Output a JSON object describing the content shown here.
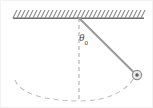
{
  "figure": {
    "name": "simple-pendulum-diagram",
    "background_color": "#ffffff"
  },
  "labels": {
    "angle_symbol": "θ",
    "angle_subscript": "0",
    "angle_full": "θ₀"
  },
  "colors": {
    "ceiling_line": "#6e6e6e",
    "hatching": "#8a8a8a",
    "rod": "#9a9a9a",
    "bob_outline": "#8f8f8f",
    "bob_fill": "#e8e8e8",
    "bob_center": "#5a5a5a",
    "dashed_line": "#b0b0b0",
    "dashed_arc": "#c0c0c0",
    "label_text": "#4a4a4a",
    "border": "#f2f2f2"
  },
  "geometry": {
    "pivot": {
      "x": 78,
      "y": 17
    },
    "bob": {
      "x": 136,
      "y": 74,
      "radius": 5
    },
    "ceiling": {
      "x_start": 12,
      "x_end": 143,
      "y": 17
    },
    "hatch_count": 32,
    "hatch_spacing": 4,
    "hatch_height": 8,
    "vertical_dashed": {
      "x": 78,
      "y_start": 17,
      "y_end": 101
    },
    "swing_arc": {
      "left_x": 14,
      "bottom_y": 99,
      "right_x": 136
    },
    "rod_length_px": 82,
    "angle_degrees": 45
  }
}
